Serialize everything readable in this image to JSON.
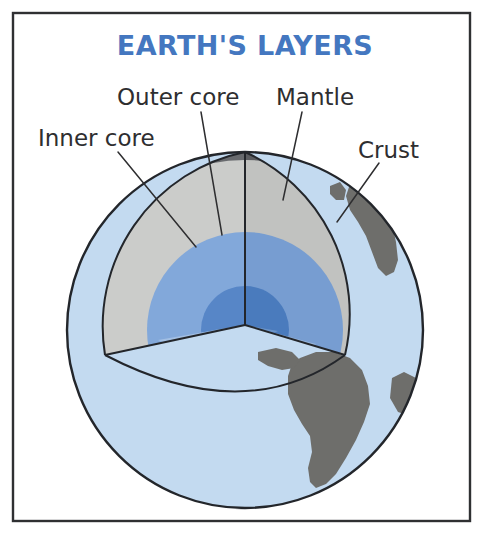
{
  "figure": {
    "kind": "cutaway-diagram",
    "title": "EARTH'S LAYERS",
    "title_color": "#4477c0",
    "background_color": "#ffffff",
    "frame_color": "#2f3032",
    "label_color": "#2e2e30"
  },
  "labels": {
    "outer_core": "Outer core",
    "mantle": "Mantle",
    "inner_core": "Inner core",
    "crust": "Crust"
  },
  "layers": [
    {
      "name": "crust",
      "label": "Crust",
      "color": "#5f6165",
      "order": 1,
      "position": "outermost"
    },
    {
      "name": "mantle",
      "label": "Mantle",
      "color": "#c8c9c7",
      "order": 2,
      "position": "outer"
    },
    {
      "name": "outer-core",
      "label": "Outer core",
      "color": "#7ba3d8",
      "order": 3,
      "position": "inner"
    },
    {
      "name": "inner-core",
      "label": "Inner core",
      "color": "#4d7fc4",
      "order": 4,
      "position": "innermost"
    }
  ],
  "globe": {
    "ocean_color": "#c3daf0",
    "land_color": "#6e6e6b",
    "outline_color": "#23262b"
  }
}
